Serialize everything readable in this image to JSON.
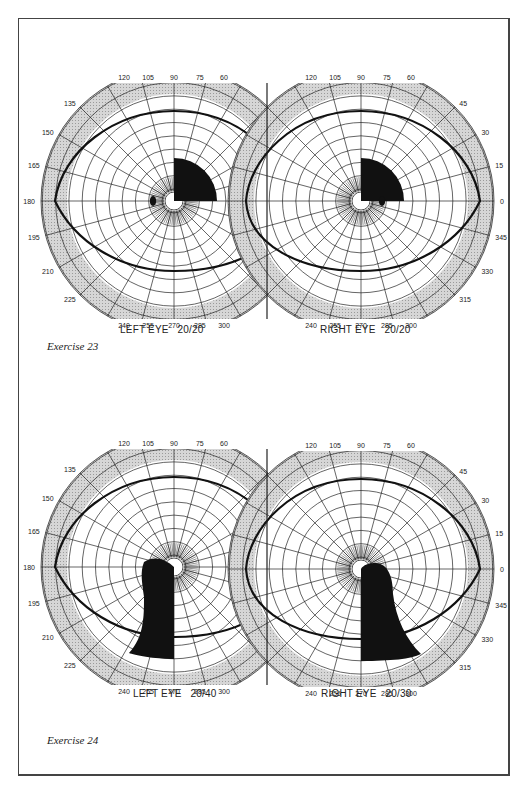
{
  "page": {
    "exercises": [
      {
        "caption": "Exercise 23",
        "left_eye": {
          "label": "LEFT EYE",
          "acuity": "20/20",
          "cx": 174,
          "cy": 201
        },
        "right_eye": {
          "label": "RIGHT EYE",
          "acuity": "20/20",
          "cx": 361,
          "cy": 201
        }
      },
      {
        "caption": "Exercise 24",
        "left_eye": {
          "label": "LEFT EYE",
          "acuity": "20/40",
          "cx": 174,
          "cy": 567
        },
        "right_eye": {
          "label": "RIGHT EYE",
          "acuity": "20/30",
          "cx": 361,
          "cy": 569
        }
      }
    ],
    "meridian_labels_left": [
      "120",
      "105",
      "90",
      "75",
      "60",
      "135",
      "150",
      "165",
      "180",
      "195",
      "210",
      "225",
      "240",
      "255",
      "270",
      "285",
      "300"
    ],
    "meridian_labels_right": [
      "120",
      "105",
      "90",
      "75",
      "60",
      "45",
      "30",
      "15",
      "0",
      "345",
      "330",
      "315",
      "240",
      "255",
      "270",
      "285",
      "300"
    ],
    "colors": {
      "ink": "#111111",
      "shade": "#c8c8c8",
      "frame": "#444444"
    }
  }
}
